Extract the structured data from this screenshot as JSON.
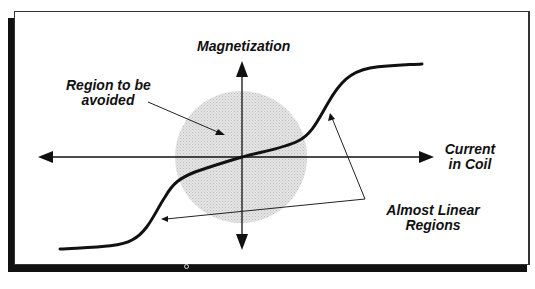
{
  "diagram": {
    "axes": {
      "y_label": "Magnetization",
      "x_label_line1": "Current",
      "x_label_line2": "in Coil"
    },
    "annotations": {
      "avoid_line1": "Region to be",
      "avoid_line2": "avoided",
      "linear_line1": "Almost Linear",
      "linear_line2": "Regions"
    },
    "colors": {
      "curve": "#111111",
      "axis": "#111111",
      "avoid_region_fill": "#d9d9d9",
      "frame_shadow": "#111111"
    },
    "curve_description": "S-shaped magnetization curve: flat saturation at low current, steep rise, almost-linear shallow segment through origin, steep rise, flat saturation at high current"
  }
}
